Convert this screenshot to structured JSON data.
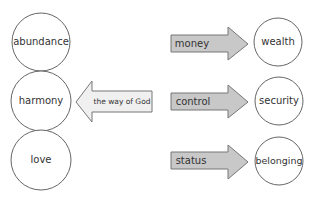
{
  "colors": {
    "stroke": "#666666",
    "arrow_right_fill": "#c8c8c8",
    "arrow_left_fill": "#f0f0f0",
    "circle_fill": "#ffffff",
    "text": "#333333"
  },
  "left_circles": [
    {
      "label": "abundance"
    },
    {
      "label": "harmony"
    },
    {
      "label": "love"
    }
  ],
  "left_arrow": {
    "label": "the way of God",
    "direction": "left"
  },
  "right_arrows": [
    {
      "label": "money",
      "direction": "right"
    },
    {
      "label": "control",
      "direction": "right"
    },
    {
      "label": "status",
      "direction": "right"
    }
  ],
  "right_circles": [
    {
      "label": "wealth"
    },
    {
      "label": "security"
    },
    {
      "label": "belonging"
    }
  ]
}
